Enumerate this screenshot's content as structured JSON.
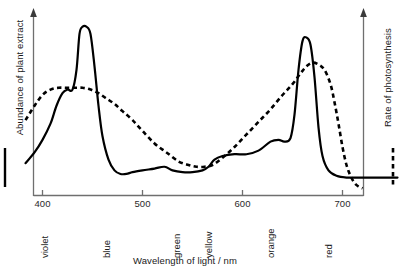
{
  "chart_data": {
    "type": "line",
    "title": "",
    "xlabel": "Wavelength of light / nm",
    "ylabel_left": "Abundance of plant extract",
    "ylabel_right": "Rate of photosynthesis",
    "xlim": [
      383,
      755
    ],
    "xticks": [
      400,
      500,
      600,
      700
    ],
    "xtick_labels": [
      "400",
      "500",
      "600",
      "700"
    ],
    "ylim": [
      0,
      100
    ],
    "grid": false,
    "legend_position": "axis-keys",
    "colour_bands": [
      {
        "label": "violet",
        "wavelength": 404
      },
      {
        "label": "blue",
        "wavelength": 466
      },
      {
        "label": "green",
        "wavelength": 536
      },
      {
        "label": "yellow",
        "wavelength": 568
      },
      {
        "label": "orange",
        "wavelength": 630
      },
      {
        "label": "red",
        "wavelength": 688
      }
    ],
    "series": [
      {
        "name": "Abundance of plant extract",
        "style": "solid",
        "axis": "left",
        "colour": "#000000",
        "x": [
          383,
          392,
          400,
          408,
          414,
          420,
          425,
          430,
          434,
          437,
          440,
          444,
          448,
          452,
          456,
          460,
          466,
          472,
          478,
          484,
          490,
          500,
          512,
          522,
          530,
          540,
          550,
          560,
          566,
          572,
          580,
          592,
          604,
          616,
          628,
          636,
          642,
          648,
          652,
          656,
          660,
          664,
          668,
          672,
          676,
          680,
          686,
          694,
          704,
          720,
          740,
          755
        ],
        "y": [
          18,
          24,
          31,
          40,
          50,
          57,
          59,
          59,
          70,
          90,
          94,
          94,
          90,
          72,
          50,
          33,
          20,
          14,
          12,
          12,
          13,
          14,
          15,
          16,
          14,
          13,
          13,
          14,
          16,
          20,
          22,
          23,
          23,
          25,
          30,
          31,
          30,
          32,
          45,
          70,
          86,
          88,
          84,
          66,
          38,
          22,
          14,
          11,
          10,
          10,
          10,
          10
        ]
      },
      {
        "name": "Rate of photosynthesis",
        "style": "dashed",
        "axis": "right",
        "colour": "#000000",
        "x": [
          383,
          392,
          400,
          408,
          416,
          424,
          432,
          440,
          448,
          456,
          464,
          472,
          480,
          490,
          500,
          512,
          524,
          536,
          546,
          554,
          562,
          570,
          580,
          592,
          604,
          616,
          628,
          640,
          650,
          658,
          664,
          670,
          676,
          682,
          688,
          692,
          696,
          700,
          704,
          708,
          712,
          716,
          720
        ],
        "y": [
          42,
          50,
          56,
          59,
          60,
          60,
          60,
          60,
          59,
          57,
          54,
          51,
          47,
          42,
          36,
          29,
          24,
          19,
          17,
          16,
          16,
          17,
          21,
          27,
          34,
          41,
          48,
          56,
          62,
          68,
          72,
          74,
          73,
          70,
          62,
          52,
          40,
          27,
          17,
          11,
          7,
          5,
          4
        ]
      }
    ]
  },
  "axes": {
    "left": {
      "label": "Abundance of plant extract",
      "key_style": "solid-line",
      "arrow": "up"
    },
    "right": {
      "label": "Rate of photosynthesis",
      "key_style": "dashed-line",
      "arrow": "up"
    },
    "bottom": {
      "label": "Wavelength of light / nm"
    }
  }
}
